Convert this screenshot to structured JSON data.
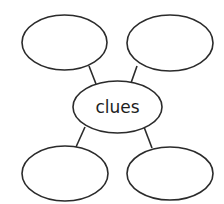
{
  "diagram": {
    "type": "web-organizer",
    "center": {
      "label": "clues"
    },
    "outer_nodes": [
      {
        "position": "top-left",
        "label": ""
      },
      {
        "position": "top-right",
        "label": ""
      },
      {
        "position": "bottom-left",
        "label": ""
      },
      {
        "position": "bottom-right",
        "label": ""
      }
    ],
    "colors": {
      "stroke": "#2b2b2b",
      "background": "#ffffff",
      "text": "#1e1e1e"
    }
  }
}
